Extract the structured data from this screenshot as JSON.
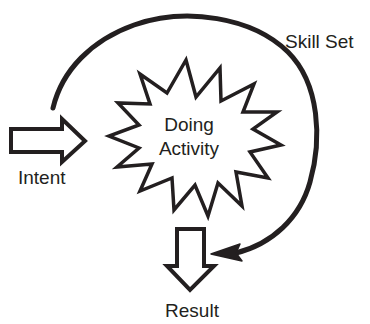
{
  "diagram": {
    "type": "process-flow-diagram",
    "background_color": "#ffffff",
    "stroke_color": "#231f20",
    "fill_color": "#ffffff",
    "text_color": "#231f20",
    "nodes": {
      "intent": {
        "label": "Intent",
        "shape": "block-arrow-right",
        "label_x": 46,
        "label_y": 184
      },
      "activity": {
        "label_line1": "Doing",
        "label_line2": "Activity",
        "shape": "starburst",
        "label_x": 189,
        "label_y": 131
      },
      "result": {
        "label": "Result",
        "shape": "block-arrow-down",
        "label_x": 192,
        "label_y": 317
      },
      "skill_set": {
        "label": "Skill Set",
        "shape": "curved-feedback-arrow",
        "label_x": 285,
        "label_y": 48
      }
    },
    "edges": [
      {
        "name": "intent-to-activity",
        "from": "intent",
        "to": "activity",
        "style": "outlined-block-arrow",
        "direction": "right"
      },
      {
        "name": "activity-to-result",
        "from": "activity",
        "to": "result",
        "style": "outlined-block-arrow",
        "direction": "down"
      },
      {
        "name": "skill-set-feedback-loop",
        "from": "intent",
        "to": "result",
        "style": "thick-curved-line-with-solid-arrowhead",
        "direction": "clockwise"
      }
    ]
  }
}
